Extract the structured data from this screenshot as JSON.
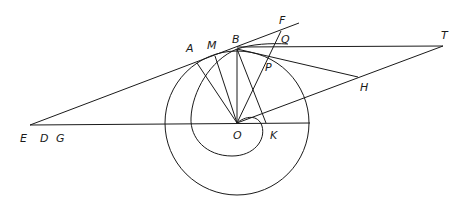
{
  "figure": {
    "background": "#ffffff",
    "stroke": "#1a1a1a"
  },
  "labels": {
    "A": "A",
    "M": "M",
    "B": "B",
    "F": "F",
    "Q": "Q",
    "P": "P",
    "T": "T",
    "H": "H",
    "E": "E",
    "D": "D",
    "G": "G",
    "O": "O",
    "K": "K"
  },
  "points": {
    "O": [
      237,
      123
    ],
    "B": [
      237,
      49
    ],
    "A": [
      193,
      64
    ],
    "M": [
      213,
      55
    ],
    "F": [
      281,
      31
    ],
    "Q": [
      283,
      39
    ],
    "P": [
      266,
      55
    ],
    "T": [
      443,
      46
    ],
    "H": [
      358,
      77
    ],
    "E": [
      30,
      125
    ],
    "K": [
      266,
      123
    ]
  }
}
